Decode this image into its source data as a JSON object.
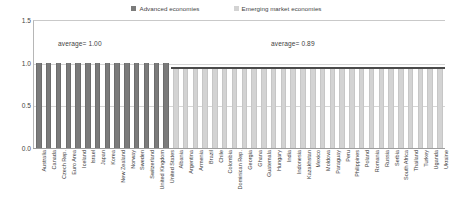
{
  "legend": {
    "entries": [
      {
        "label": "Advanced economies",
        "color": "#7b7b7b",
        "icon": "square-swatch-icon"
      },
      {
        "label": "Emerging market economies",
        "color": "#d3d3d3",
        "icon": "square-swatch-icon"
      }
    ]
  },
  "annotations": {
    "advanced": "average= 1.00",
    "emerging": "average= 0.89"
  },
  "axis": {
    "y_ticks": [
      "1.5",
      "1.0",
      "0.5",
      "0.0"
    ]
  },
  "chart_data": {
    "type": "bar",
    "title": "",
    "subtitle": "",
    "xlabel": "",
    "ylabel": "",
    "ylim": [
      0.0,
      1.5
    ],
    "yticks": [
      0.0,
      0.5,
      1.0,
      1.5
    ],
    "grid": true,
    "legend_position": "top-center",
    "series": [
      {
        "name": "Advanced economies",
        "color": "#7b7b7b",
        "average": 1.0,
        "categories": [
          "Australia",
          "Canada",
          "Czech Rep.",
          "Euro Area",
          "Iceland",
          "Israel",
          "Japan",
          "Korea",
          "New Zealand",
          "Norway",
          "Sweden",
          "Switzerland",
          "United Kingdom",
          "United States"
        ],
        "values": [
          1.0,
          1.0,
          1.0,
          1.0,
          1.0,
          1.0,
          1.0,
          1.0,
          1.0,
          1.0,
          1.0,
          1.0,
          1.0,
          1.0
        ]
      },
      {
        "name": "Emerging market economies",
        "color": "#d3d3d3",
        "average": 0.89,
        "categories": [
          "Albania",
          "Argentina",
          "Armenia",
          "Brazil",
          "Chile",
          "Colombia",
          "Dominican Rep.",
          "Georgia",
          "Ghana",
          "Guatemala",
          "Hungary",
          "India",
          "Indonesia",
          "Kazakhstan",
          "Mexico",
          "Moldova",
          "Paraguay",
          "Peru",
          "Philippines",
          "Poland",
          "Romania",
          "Russia",
          "Serbia",
          "South Africa",
          "Thailand",
          "Turkey",
          "Uganda",
          "Ukraine"
        ],
        "values": [
          0.93,
          0.93,
          0.93,
          0.93,
          0.93,
          0.93,
          0.93,
          0.93,
          0.93,
          0.93,
          0.93,
          0.93,
          0.93,
          0.93,
          0.93,
          0.93,
          0.93,
          0.93,
          0.93,
          0.93,
          0.93,
          0.93,
          0.93,
          0.93,
          0.93,
          0.93,
          0.93,
          0.93
        ]
      }
    ],
    "reference_line": {
      "value": 0.93,
      "color": "#4a4a4a",
      "applies_to": "Emerging market economies"
    }
  }
}
